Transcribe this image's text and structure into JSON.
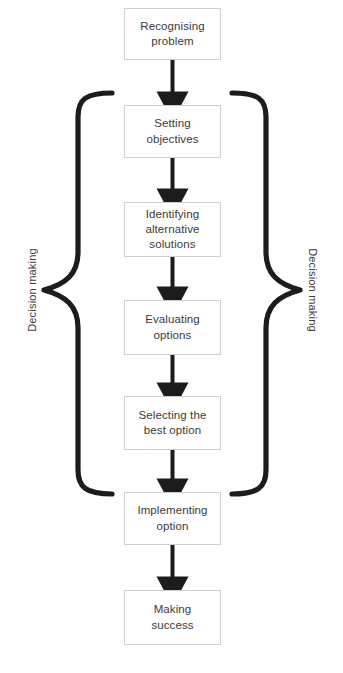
{
  "diagram": {
    "background_color": "#ffffff",
    "box_border_color": "#cfcfcf",
    "arrow_color": "#1c1c1c",
    "brace_color": "#1c1c1c",
    "text_color": "#3a3a3a"
  },
  "nodes": [
    {
      "id": "recognising-problem",
      "label": "Recognising\nproblem"
    },
    {
      "id": "setting-objectives",
      "label": "Setting objectives"
    },
    {
      "id": "identifying-alternatives",
      "label": "Identifying\nalternative\nsolutions"
    },
    {
      "id": "evaluating-options",
      "label": "Evaluating\noptions"
    },
    {
      "id": "selecting-best-option",
      "label": "Selecting the\nbest option"
    },
    {
      "id": "implementing-option",
      "label": "Implementing\noption"
    },
    {
      "id": "making-success",
      "label": "Making\nsuccess"
    }
  ],
  "side_labels": {
    "left": "Decision making",
    "right": "Decision making"
  },
  "connectors": [
    {
      "from": "recognising-problem",
      "to": "setting-objectives",
      "type": "arrow-down"
    },
    {
      "from": "setting-objectives",
      "to": "identifying-alternatives",
      "type": "arrow-down"
    },
    {
      "from": "identifying-alternatives",
      "to": "evaluating-options",
      "type": "arrow-down"
    },
    {
      "from": "evaluating-options",
      "to": "selecting-best-option",
      "type": "arrow-down"
    },
    {
      "from": "selecting-best-option",
      "to": "implementing-option",
      "type": "arrow-down"
    },
    {
      "from": "implementing-option",
      "to": "making-success",
      "type": "arrow-down"
    }
  ],
  "braces": [
    {
      "id": "left-brace",
      "orientation": "left",
      "spans": "setting-objectives..selecting-best-option"
    },
    {
      "id": "right-brace",
      "orientation": "right",
      "spans": "setting-objectives..selecting-best-option"
    }
  ],
  "bottom_caption": ""
}
